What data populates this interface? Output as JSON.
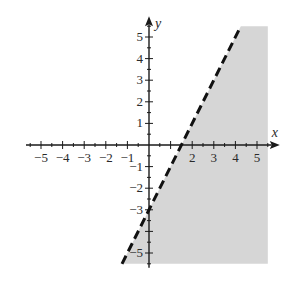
{
  "chart_data": {
    "type": "inequality-graph",
    "title": "",
    "xlabel": "x",
    "ylabel": "y",
    "xlim": [
      -5.5,
      5.5
    ],
    "ylim": [
      -5.5,
      5.5
    ],
    "x_tick_labels": [
      "-5",
      "-4",
      "-3",
      "-2",
      "-1",
      "2",
      "3",
      "4",
      "5"
    ],
    "y_tick_labels": [
      "5",
      "4",
      "3",
      "2",
      "1",
      "-1",
      "-2",
      "-3",
      "-5"
    ],
    "minor_tick_step": 0.5,
    "grid": false,
    "boundary_line": {
      "equation": "y = 2x - 3",
      "slope": 2,
      "intercept": -3,
      "x_intercept": 1.5,
      "style": "dashed"
    },
    "shaded_region": {
      "inequality": "y < 2x - 3",
      "side": "below-right of line",
      "color": "#d6d6d6"
    }
  },
  "colors": {
    "axis": "#1a1a1a",
    "line": "#111111",
    "shade": "#d6d6d6"
  }
}
